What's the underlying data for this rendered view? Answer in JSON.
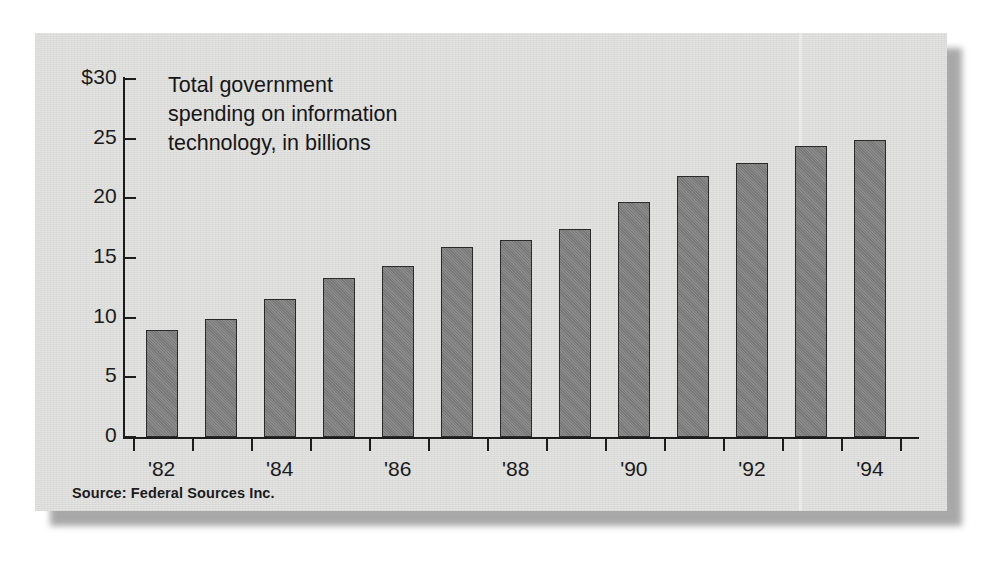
{
  "figure": {
    "title_lines": [
      "Total government",
      "spending on information",
      "technology, in billions"
    ],
    "source": "Source: Federal Sources Inc.",
    "panel_color": "#e3e3e1",
    "bar_color": "#7e7e7e",
    "bar_border_color": "#2a2a2a",
    "axis_color": "#1d1d1d"
  },
  "chart_data": {
    "type": "bar",
    "title": "Total government spending on information technology, in billions",
    "xlabel": "",
    "ylabel": "",
    "ylim": [
      0,
      30
    ],
    "yticks": [
      0,
      5,
      10,
      15,
      20,
      25,
      30
    ],
    "ytick_labels": [
      "0",
      "5",
      "10",
      "15",
      "20",
      "25",
      "$30"
    ],
    "grid": false,
    "legend": null,
    "categories": [
      "'82",
      "'83",
      "'84",
      "'85",
      "'86",
      "'87",
      "'88",
      "'89",
      "'90",
      "'91",
      "'92",
      "'93",
      "'94"
    ],
    "xtick_labels_shown": [
      "'82",
      "'84",
      "'86",
      "'88",
      "'90",
      "'92",
      "'94"
    ],
    "values": [
      9.0,
      9.9,
      11.6,
      13.3,
      14.3,
      15.9,
      16.5,
      17.4,
      19.7,
      21.9,
      23.0,
      24.4,
      24.9
    ],
    "units": "billions of dollars",
    "source": "Federal Sources Inc."
  }
}
